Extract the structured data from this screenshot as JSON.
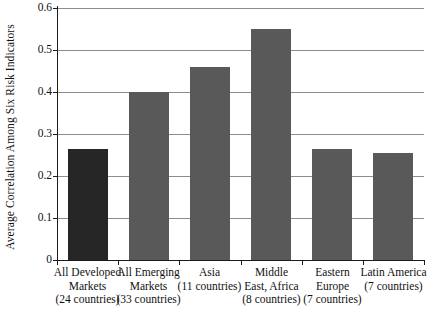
{
  "chart_data": {
    "type": "bar",
    "title": "",
    "xlabel": "",
    "ylabel": "Average Correlation Among Six Risk Indicators",
    "ylim": [
      0,
      0.6
    ],
    "yticks": [
      "0",
      "0.1",
      "0.2",
      "0.3",
      "0.4",
      "0.5",
      "0.6"
    ],
    "ytick_values": [
      0,
      0.1,
      0.2,
      0.3,
      0.4,
      0.5,
      0.6
    ],
    "grid": "horizontal",
    "legend": "none",
    "categories": [
      "All Developed Markets (24 countries)",
      "All Emerging Markets (33 countries)",
      "Asia (11 countries)",
      "Middle East, Africa (8 countries)",
      "Eastern Europe (7 countries)",
      "Latin America (7 countries)"
    ],
    "category_lines": [
      [
        "All Developed",
        "Markets",
        "(24 countries)"
      ],
      [
        "All Emerging",
        "Markets",
        "(33 countries)"
      ],
      [
        "Asia",
        "(11 countries)"
      ],
      [
        "Middle",
        "East, Africa",
        "(8 countries)"
      ],
      [
        "Eastern",
        "Europe",
        "(7 countries)"
      ],
      [
        "Latin America",
        "(7 countries)"
      ]
    ],
    "values": [
      0.265,
      0.4,
      0.46,
      0.55,
      0.265,
      0.255
    ],
    "bar_colors": [
      "#262626",
      "#595959",
      "#595959",
      "#595959",
      "#595959",
      "#595959"
    ],
    "colors": {
      "bar_highlight": "#262626",
      "bar_default": "#595959",
      "gridline": "#8d8d8d",
      "axis": "#1b1b1b",
      "background": "#ffffff",
      "text": "#111111"
    }
  }
}
